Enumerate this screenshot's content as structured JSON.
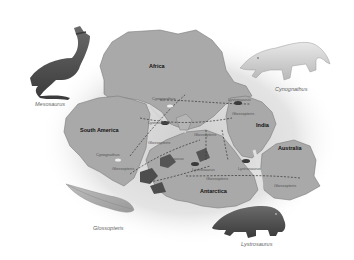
{
  "figure": {
    "colors": {
      "background": "#ffffff",
      "landmass": "#a9a9a9",
      "landmass_edge": "#7a7a7a",
      "glow": "#d8d8d8",
      "region_dark": "#4d4d4d",
      "text_dark": "#111111",
      "text_label": "#555555"
    }
  },
  "continents": [
    {
      "name": "Africa"
    },
    {
      "name": "South America"
    },
    {
      "name": "India"
    },
    {
      "name": "Australia"
    },
    {
      "name": "Antarctica"
    }
  ],
  "fossil_labels": [
    {
      "text": "Cynognathus"
    },
    {
      "text": "Lystrosaurus"
    },
    {
      "text": "Glossopteris"
    },
    {
      "text": "Cynognathus"
    },
    {
      "text": "Glossopteris"
    },
    {
      "text": "Lystrosaurus"
    },
    {
      "text": "Glossopteris"
    },
    {
      "text": "Mesosaurus"
    },
    {
      "text": "Lystrosaurus"
    },
    {
      "text": "Glossopteris"
    },
    {
      "text": "Glossopteris"
    },
    {
      "text": "Lystrosaurus"
    },
    {
      "text": "Glossopteris"
    }
  ],
  "species": [
    {
      "name": "Mesosaurus"
    },
    {
      "name": "Cynognathus"
    },
    {
      "name": "Glossopteris"
    },
    {
      "name": "Lystrosaurus"
    }
  ]
}
